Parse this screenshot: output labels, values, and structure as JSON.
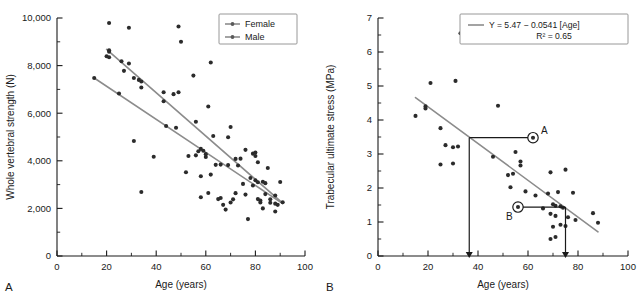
{
  "figure": {
    "panel_a_letter": "A",
    "panel_b_letter": "B"
  },
  "chart_data": [
    {
      "type": "scatter",
      "panel": "A",
      "title": "",
      "xlabel": "Age (years)",
      "ylabel": "Whole vertebral strength (N)",
      "xlim": [
        0,
        100
      ],
      "ylim": [
        0,
        10000
      ],
      "xticks": [
        0,
        20,
        40,
        60,
        80,
        100
      ],
      "xticklabels": [
        "0",
        "20",
        "40",
        "60",
        "80",
        "100"
      ],
      "yticks": [
        0,
        2000,
        4000,
        6000,
        8000,
        10000
      ],
      "yticklabels": [
        "0",
        "2,000",
        "4,000",
        "6,000",
        "8,000",
        "10,000"
      ],
      "minor_xtick_interval": 10,
      "minor_ytick_interval": 1000,
      "grid": false,
      "legend_position": "top-right",
      "legend": [
        {
          "name": "Female",
          "color": "#8c8c8c"
        },
        {
          "name": "Male",
          "color": "#8c8c8c"
        }
      ],
      "series": [
        {
          "name": "Male",
          "color": "#8c8c8c",
          "fit_line": {
            "x": [
              20,
              91
            ],
            "y": [
              8680,
              2220
            ]
          },
          "points": [
            [
              21,
              9790
            ],
            [
              29,
              9590
            ],
            [
              49,
              9640
            ],
            [
              50,
              9000
            ],
            [
              21,
              8640
            ],
            [
              21,
              8580
            ],
            [
              20,
              8390
            ],
            [
              21,
              8350
            ],
            [
              26,
              8180
            ],
            [
              29,
              8090
            ],
            [
              27,
              7780
            ],
            [
              31,
              7480
            ],
            [
              33,
              7400
            ],
            [
              34,
              7330
            ],
            [
              55,
              7580
            ],
            [
              62,
              8130
            ],
            [
              34,
              7080
            ],
            [
              43,
              6880
            ],
            [
              47,
              6800
            ],
            [
              49,
              6880
            ],
            [
              43,
              6500
            ],
            [
              61,
              6280
            ],
            [
              56,
              5640
            ],
            [
              63,
              5040
            ],
            [
              70,
              5420
            ],
            [
              69,
              4990
            ],
            [
              58,
              4500
            ],
            [
              59,
              4420
            ],
            [
              57,
              4400
            ],
            [
              60,
              4280
            ],
            [
              76,
              4460
            ],
            [
              79,
              4300
            ],
            [
              80,
              4350
            ],
            [
              80,
              4200
            ],
            [
              72,
              4080
            ],
            [
              74,
              4090
            ],
            [
              66,
              3840
            ],
            [
              69,
              3820
            ],
            [
              81,
              3940
            ],
            [
              85,
              3700
            ],
            [
              78,
              3280
            ],
            [
              80,
              3180
            ],
            [
              81,
              3100
            ],
            [
              83,
              3120
            ],
            [
              90,
              3110
            ],
            [
              88,
              2540
            ],
            [
              84,
              2600
            ],
            [
              82,
              2330
            ],
            [
              86,
              2240
            ],
            [
              91,
              2260
            ],
            [
              89,
              2150
            ],
            [
              88,
              1870
            ]
          ]
        },
        {
          "name": "Female",
          "color": "#8c8c8c",
          "fit_line": {
            "x": [
              15,
              91
            ],
            "y": [
              7480,
              2200
            ]
          },
          "points": [
            [
              15,
              7480
            ],
            [
              25,
              6830
            ],
            [
              31,
              4830
            ],
            [
              39,
              4170
            ],
            [
              44,
              5460
            ],
            [
              48,
              5390
            ],
            [
              34,
              2690
            ],
            [
              53,
              4200
            ],
            [
              56,
              4230
            ],
            [
              52,
              3520
            ],
            [
              58,
              3350
            ],
            [
              60,
              4160
            ],
            [
              61,
              2650
            ],
            [
              58,
              2470
            ],
            [
              65,
              2390
            ],
            [
              67,
              2150
            ],
            [
              68,
              1950
            ],
            [
              66,
              2440
            ],
            [
              70,
              2250
            ],
            [
              71,
              2380
            ],
            [
              72,
              2640
            ],
            [
              73,
              3800
            ],
            [
              76,
              2580
            ],
            [
              77,
              1550
            ],
            [
              81,
              2390
            ],
            [
              82,
              2250
            ],
            [
              83,
              2000
            ],
            [
              86,
              2380
            ],
            [
              84,
              3060
            ],
            [
              79,
              2960
            ],
            [
              75,
              3030
            ],
            [
              64,
              3830
            ],
            [
              62,
              3420
            ],
            [
              88,
              2200
            ]
          ]
        }
      ]
    },
    {
      "type": "scatter",
      "panel": "B",
      "title": "",
      "xlabel": "Age (years)",
      "ylabel": "Trabecular ultimate stress (MPa)",
      "xlim": [
        0,
        100
      ],
      "ylim": [
        0,
        7
      ],
      "xticks": [
        0,
        20,
        40,
        60,
        80,
        100
      ],
      "xticklabels": [
        "0",
        "20",
        "40",
        "60",
        "80",
        "100"
      ],
      "yticks": [
        0,
        1,
        2,
        3,
        4,
        5,
        6,
        7
      ],
      "yticklabels": [
        "0",
        "1",
        "2",
        "3",
        "4",
        "5",
        "6",
        "7"
      ],
      "minor_xtick_interval": 10,
      "minor_ytick_interval": 0.5,
      "grid": false,
      "legend_position": "top-right",
      "legend": [
        {
          "name": "Y = 5.47 − 0.0541 [Age]",
          "color": "#8c8c8c"
        },
        {
          "name": "R² = 0.65",
          "color": "#8c8c8c"
        }
      ],
      "regression": {
        "equation": "Y = 5.47 − 0.0541 [Age]",
        "r_squared_label": "R² = 0.65",
        "intercept": 5.47,
        "slope": -0.0541,
        "r_squared": 0.65,
        "line": {
          "x": [
            15,
            88
          ],
          "y": [
            4.66,
            0.71
          ]
        }
      },
      "series": [
        {
          "name": "Trabecular ultimate stress",
          "color": "#2b2b2b",
          "points": [
            [
              33,
              6.55
            ],
            [
              21,
              5.09
            ],
            [
              31,
              5.15
            ],
            [
              15,
              4.12
            ],
            [
              19,
              4.4
            ],
            [
              19,
              4.34
            ],
            [
              48,
              4.42
            ],
            [
              25,
              3.76
            ],
            [
              27,
              3.26
            ],
            [
              30,
              3.2
            ],
            [
              32,
              3.22
            ],
            [
              25,
              2.69
            ],
            [
              30,
              2.72
            ],
            [
              46,
              2.92
            ],
            [
              55,
              3.06
            ],
            [
              57,
              2.78
            ],
            [
              57,
              2.66
            ],
            [
              69,
              2.46
            ],
            [
              75,
              2.54
            ],
            [
              52,
              2.38
            ],
            [
              54,
              2.42
            ],
            [
              53,
              2.02
            ],
            [
              59,
              1.9
            ],
            [
              63,
              1.78
            ],
            [
              68,
              1.84
            ],
            [
              72,
              1.88
            ],
            [
              78,
              1.86
            ],
            [
              70,
              1.52
            ],
            [
              71,
              1.48
            ],
            [
              73,
              1.46
            ],
            [
              74,
              1.42
            ],
            [
              66,
              1.4
            ],
            [
              69,
              1.24
            ],
            [
              71,
              1.18
            ],
            [
              76,
              1.14
            ],
            [
              79,
              1.06
            ],
            [
              86,
              1.26
            ],
            [
              88,
              0.98
            ],
            [
              70,
              0.86
            ],
            [
              73,
              0.92
            ],
            [
              75,
              0.88
            ],
            [
              69,
              0.5
            ],
            [
              71,
              0.56
            ],
            [
              62,
              3.48
            ],
            [
              56,
              1.44
            ]
          ]
        }
      ],
      "annotations": [
        {
          "label": "A",
          "marker": {
            "x": 62,
            "y": 3.48
          },
          "horizontal_line": {
            "from_x": 36.5,
            "to_x": 60,
            "y": 3.48
          },
          "arrow": {
            "x": 36.5,
            "from_y": 3.48,
            "to_y": 0.08
          }
        },
        {
          "label": "B",
          "marker": {
            "x": 56,
            "y": 1.44
          },
          "horizontal_line": {
            "from_x": 58,
            "to_x": 75,
            "y": 1.44
          },
          "arrow": {
            "x": 75,
            "from_y": 1.44,
            "to_y": 0.08
          }
        }
      ]
    }
  ]
}
